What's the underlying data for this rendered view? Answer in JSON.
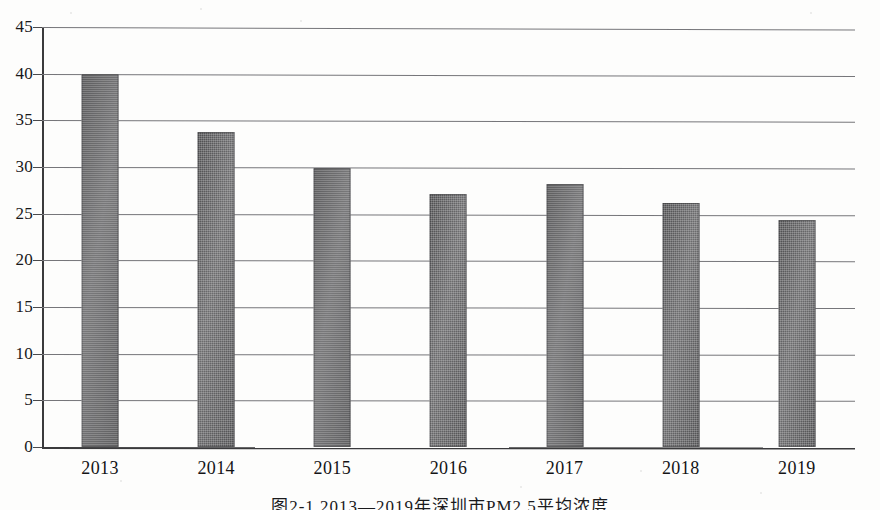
{
  "figure": {
    "caption": "图2-1  2013—2019年深圳市PM2.5平均浓度"
  },
  "chart_data": {
    "type": "bar",
    "title": "",
    "subtitle": "",
    "xlabel": "",
    "ylabel": "",
    "categories": [
      "2013",
      "2014",
      "2015",
      "2016",
      "2017",
      "2018",
      "2019"
    ],
    "values": [
      40.0,
      33.7,
      29.9,
      27.1,
      28.2,
      26.1,
      24.3
    ],
    "series": [
      {
        "name": "PM2.5平均浓度",
        "values": [
          40.0,
          33.7,
          29.9,
          27.1,
          28.2,
          26.1,
          24.3
        ]
      }
    ],
    "ylim": [
      0,
      45
    ],
    "ytick_step": 5,
    "yticks": [
      0,
      5,
      10,
      15,
      20,
      25,
      30,
      35,
      40,
      45
    ],
    "ytick_labels": [
      "0",
      "5",
      "10",
      "15",
      "20",
      "25",
      "30",
      "35",
      "40",
      "45"
    ],
    "grid": true,
    "grid_axis": "y",
    "legend": false,
    "legend_position": "none",
    "bar_color": "#5c5c5e",
    "axis_color": "#3a3a3c",
    "grid_color": "#76767a",
    "background": "#ffffff"
  }
}
